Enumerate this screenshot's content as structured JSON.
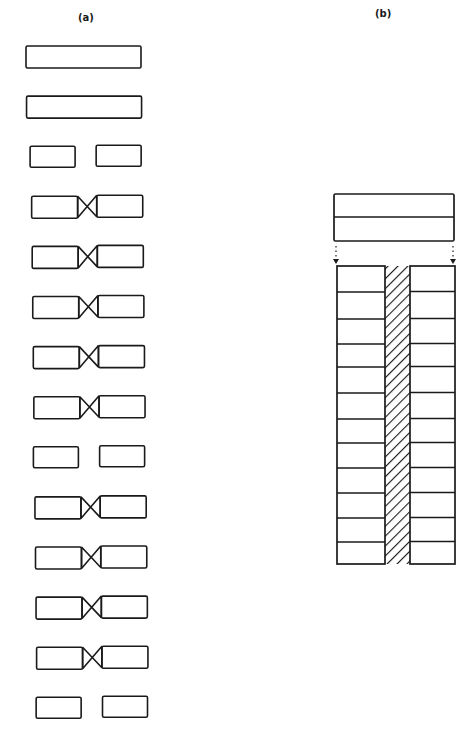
{
  "panels": {
    "a": {
      "label": "(a)",
      "description": "Column of paired blocks: intact bars, separated pairs, and pairs joined by crossed (X) connectors",
      "rows": [
        {
          "type": "full"
        },
        {
          "type": "full"
        },
        {
          "type": "gap"
        },
        {
          "type": "cross"
        },
        {
          "type": "cross"
        },
        {
          "type": "cross"
        },
        {
          "type": "cross"
        },
        {
          "type": "cross"
        },
        {
          "type": "gap"
        },
        {
          "type": "cross"
        },
        {
          "type": "cross"
        },
        {
          "type": "cross"
        },
        {
          "type": "cross"
        },
        {
          "type": "gap"
        }
      ]
    },
    "b": {
      "label": "(b)",
      "description": "Two-layer top bar separated by dotted arrows from a stack of paired cells flanking a diagonally hatched central strip",
      "top_bar_layers": 2,
      "stack_rows": 12,
      "center_strip_pattern": "diagonal-hatch"
    }
  },
  "colors": {
    "stroke": "#1a1a1a",
    "background": "#ffffff"
  }
}
